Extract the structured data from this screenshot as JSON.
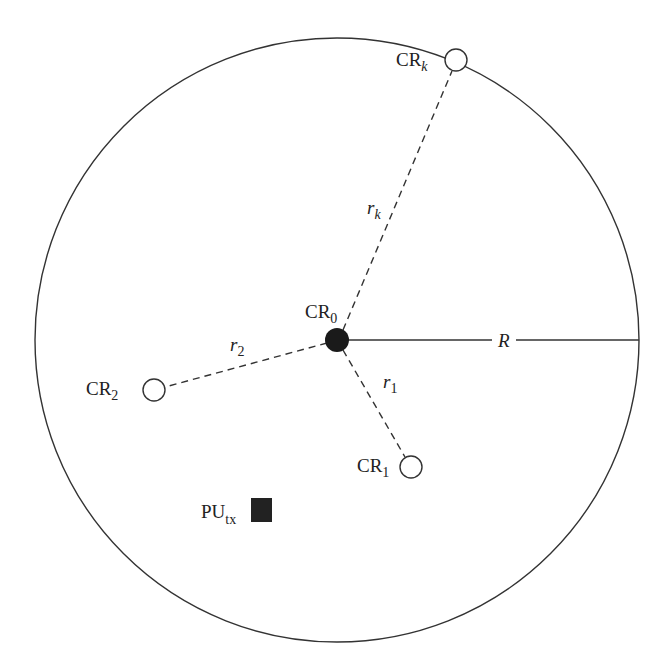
{
  "diagram": {
    "boundary": {
      "cx": 337,
      "cy": 340,
      "r": 302,
      "stroke": "#333333"
    },
    "center_node": {
      "id": "CR",
      "sub": "0",
      "x": 337,
      "y": 340,
      "r": 11,
      "fill": "#1a1a1a"
    },
    "radius_line": {
      "label": "R",
      "x1": 348,
      "y1": 340,
      "x2": 639,
      "y2": 340
    },
    "nodes": [
      {
        "id": "CR",
        "sub": "k",
        "x": 456,
        "y": 60,
        "r": 11,
        "link_label": "r",
        "link_sub": "k"
      },
      {
        "id": "CR",
        "sub": "2",
        "x": 154,
        "y": 390,
        "r": 11,
        "link_label": "r",
        "link_sub": "2"
      },
      {
        "id": "CR",
        "sub": "1",
        "x": 411,
        "y": 467,
        "r": 11,
        "link_label": "r",
        "link_sub": "1"
      }
    ],
    "primary_user": {
      "id": "PU",
      "sub": "tx",
      "x": 251,
      "y": 498,
      "w": 21,
      "h": 24,
      "fill": "#222222"
    }
  }
}
